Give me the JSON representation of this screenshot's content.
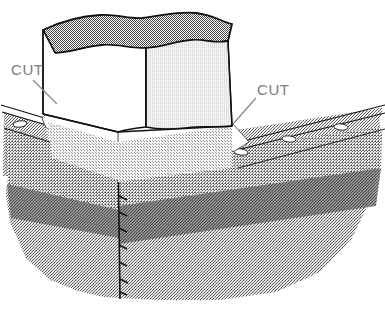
{
  "figure": {
    "type": "technical-line-illustration"
  },
  "annotations": [
    {
      "id": "cut-left",
      "label": "CUT",
      "x": 11,
      "y": 62,
      "leader": {
        "from": [
          33,
          80
        ],
        "to": [
          57,
          104
        ]
      }
    },
    {
      "id": "cut-right",
      "label": "CUT",
      "x": 257,
      "y": 82,
      "leader": {
        "from": [
          256,
          98
        ],
        "to": [
          233,
          124
        ]
      }
    }
  ],
  "colors": {
    "label_text": "#7d7d7d",
    "leader_line": "#8a8a8a",
    "outline": "#111111",
    "block_top_face": "#9a9a9a",
    "block_left_face": "#ffffff",
    "block_right_face": "#e9e9e9",
    "soil_upper": "#b9b9b9",
    "soil_gravel": "#bdbdbd",
    "soil_mid": "#a8a8a8",
    "soil_dark": "#6f6f6f",
    "soil_lower": "#9d9d9d",
    "background": "#ffffff",
    "stone_fill": "#ffffff"
  },
  "elements": {
    "stone_block": "stone-block",
    "ground_mass": "ground-mass",
    "ground_surface_left": "ground-surface-line-left",
    "ground_surface_right": "ground-surface-line-right",
    "gravel_stones": "gravel-stone-ovals",
    "corner_edge": "ground-corner-edge",
    "corner_ticks": "corner-tick-marks",
    "strata_dark_band": "dark-soil-stratum"
  },
  "gravel_ovals": [
    {
      "cx": 20,
      "cy": 124,
      "rx": 7,
      "ry": 3,
      "rot": -8
    },
    {
      "cx": 241,
      "cy": 152,
      "rx": 7,
      "ry": 3,
      "rot": 7
    },
    {
      "cx": 289,
      "cy": 139,
      "rx": 7,
      "ry": 3,
      "rot": 6
    },
    {
      "cx": 341,
      "cy": 127,
      "rx": 7,
      "ry": 3,
      "rot": 5
    }
  ],
  "corner_ticks_y": [
    196,
    212,
    228,
    245,
    262,
    279,
    292
  ]
}
